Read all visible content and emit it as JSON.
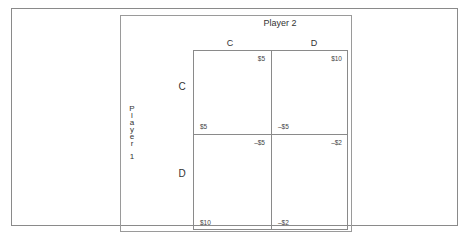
{
  "diagram": {
    "player2": {
      "label": "Player 2",
      "strategies": [
        "C",
        "D"
      ]
    },
    "player1": {
      "label_chars": [
        "P",
        "l",
        "a",
        "y",
        "e",
        "r",
        "1"
      ],
      "strategies": [
        "C",
        "D"
      ]
    },
    "cells": {
      "cc": {
        "player1": "$5",
        "player2": "$5"
      },
      "cd": {
        "player1": "–$5",
        "player2": "$10"
      },
      "dc": {
        "player1": "$10",
        "player2": "–$5"
      },
      "dd": {
        "player1": "–$2",
        "player2": "–$2"
      }
    },
    "colors": {
      "line": "#8a8a8a",
      "text": "#333333",
      "background": "#ffffff"
    }
  }
}
